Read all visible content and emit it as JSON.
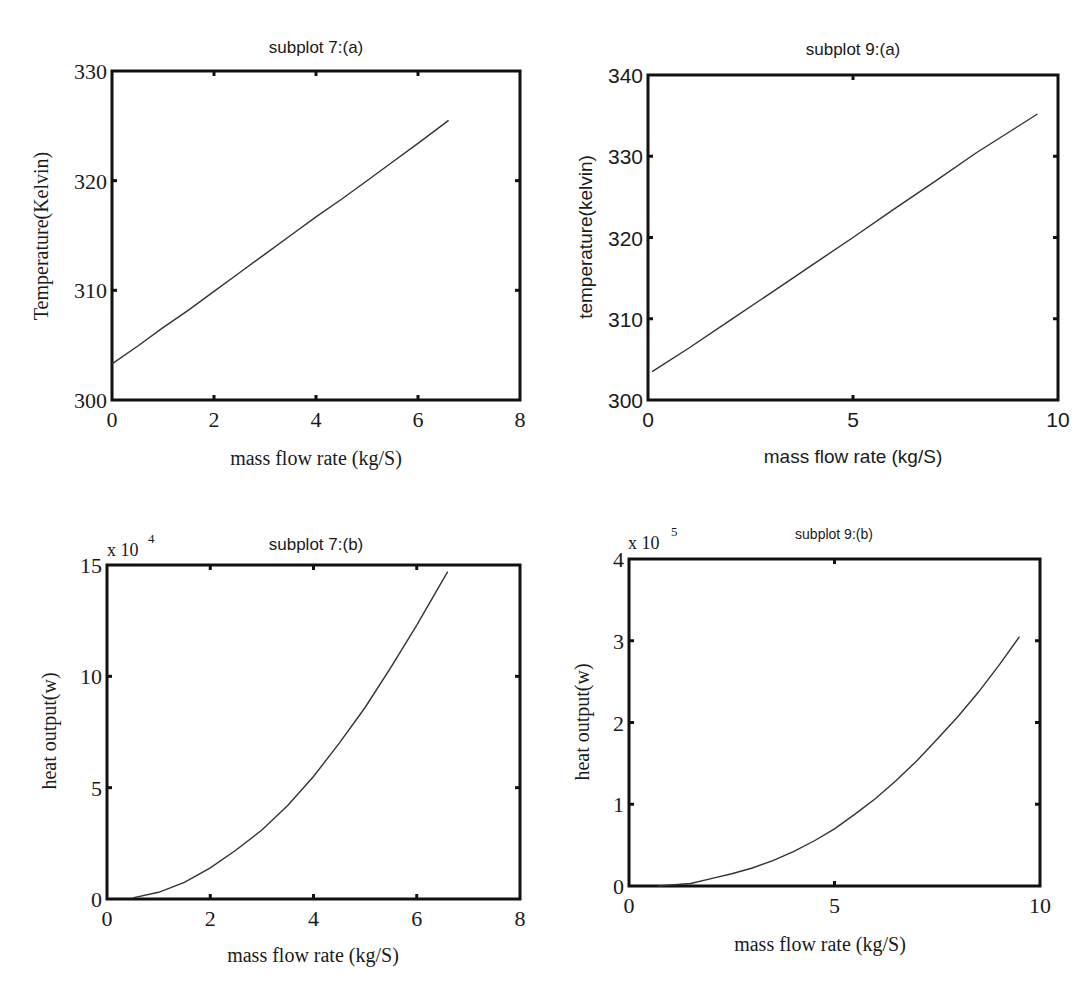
{
  "figure": {
    "panels": [
      {
        "id": "p7a",
        "title": "subplot 7:(a)",
        "xlabel": "mass flow rate (kg/S)",
        "ylabel": "Temperature(Kelvin)",
        "exponent": ""
      },
      {
        "id": "p9a",
        "title": "subplot 9:(a)",
        "xlabel": "mass flow rate (kg/S)",
        "ylabel": "temperature(kelvin)",
        "exponent": ""
      },
      {
        "id": "p7b",
        "title": "subplot 7:(b)",
        "xlabel": "mass flow rate (kg/S)",
        "ylabel": "heat output(w)",
        "exponent": "x 10^4"
      },
      {
        "id": "p9b",
        "title": "subplot 9:(b)",
        "xlabel": "mass flow rate (kg/S)",
        "ylabel": "heat output(w)",
        "exponent": "x 10^5"
      }
    ]
  },
  "chart_data": [
    {
      "type": "line",
      "title": "subplot 7:(a)",
      "xlabel": "mass flow rate (kg/S)",
      "ylabel": "Temperature(Kelvin)",
      "xlim": [
        0,
        8
      ],
      "ylim": [
        300,
        330
      ],
      "xticks": [
        0,
        2,
        4,
        6,
        8
      ],
      "yticks": [
        300,
        310,
        320,
        330
      ],
      "grid": false,
      "legend": null,
      "series": [
        {
          "name": "Temperature",
          "x": [
            0,
            0.5,
            1,
            1.5,
            2,
            2.5,
            3,
            3.5,
            4,
            4.5,
            5,
            5.5,
            6,
            6.6
          ],
          "y": [
            303.3,
            304.9,
            306.6,
            308.2,
            309.9,
            311.6,
            313.3,
            315.0,
            316.7,
            318.3,
            320.0,
            321.7,
            323.4,
            325.5
          ]
        }
      ],
      "frame_px": {
        "left": 112,
        "top": 71,
        "right": 520,
        "bottom": 400
      }
    },
    {
      "type": "line",
      "title": "subplot 9:(a)",
      "xlabel": "mass flow rate (kg/S)",
      "ylabel": "temperature(kelvin)",
      "xlim": [
        0,
        10
      ],
      "ylim": [
        300,
        340
      ],
      "xticks": [
        0,
        5,
        10
      ],
      "yticks": [
        300,
        310,
        320,
        330,
        340
      ],
      "grid": false,
      "legend": null,
      "series": [
        {
          "name": "temperature",
          "x": [
            0.1,
            1,
            2,
            3,
            4,
            5,
            6,
            7,
            8,
            9,
            9.5
          ],
          "y": [
            303.5,
            306.4,
            309.8,
            313.2,
            316.6,
            320.0,
            323.5,
            326.9,
            330.4,
            333.6,
            335.2
          ]
        }
      ],
      "frame_px": {
        "left": 648,
        "top": 75,
        "right": 1058,
        "bottom": 400
      }
    },
    {
      "type": "line",
      "title": "subplot 7:(b)",
      "xlabel": "mass flow rate (kg/S)",
      "ylabel": "heat output(w)",
      "y_multiplier": "x 10^4",
      "xlim": [
        0,
        8
      ],
      "ylim": [
        0,
        15
      ],
      "xticks": [
        0,
        2,
        4,
        6,
        8
      ],
      "yticks": [
        0,
        5,
        10,
        15
      ],
      "grid": false,
      "legend": null,
      "series": [
        {
          "name": "heat output",
          "x": [
            0.5,
            1,
            1.5,
            2,
            2.5,
            3,
            3.5,
            4,
            4.5,
            5,
            5.5,
            6,
            6.6
          ],
          "y": [
            0.05,
            0.3,
            0.75,
            1.4,
            2.2,
            3.1,
            4.2,
            5.5,
            7.0,
            8.6,
            10.4,
            12.3,
            14.7
          ]
        }
      ],
      "frame_px": {
        "left": 107,
        "top": 565,
        "right": 520,
        "bottom": 899
      }
    },
    {
      "type": "line",
      "title": "subplot 9:(b)",
      "xlabel": "mass flow rate (kg/S)",
      "ylabel": "heat output(w)",
      "y_multiplier": "x 10^5",
      "xlim": [
        0,
        10
      ],
      "ylim": [
        0,
        4
      ],
      "xticks": [
        0,
        5,
        10
      ],
      "yticks": [
        0,
        1,
        2,
        3,
        4
      ],
      "grid": false,
      "legend": null,
      "series": [
        {
          "name": "heat output",
          "x": [
            0.7,
            1.5,
            2,
            2.5,
            3,
            3.5,
            4,
            4.5,
            5,
            5.5,
            6,
            6.5,
            7,
            7.5,
            8,
            8.5,
            9,
            9.5
          ],
          "y": [
            0.0,
            0.03,
            0.09,
            0.15,
            0.22,
            0.31,
            0.42,
            0.55,
            0.7,
            0.88,
            1.07,
            1.29,
            1.53,
            1.8,
            2.07,
            2.37,
            2.7,
            3.05
          ]
        }
      ],
      "frame_px": {
        "left": 629,
        "top": 559,
        "right": 1040,
        "bottom": 886
      }
    }
  ]
}
